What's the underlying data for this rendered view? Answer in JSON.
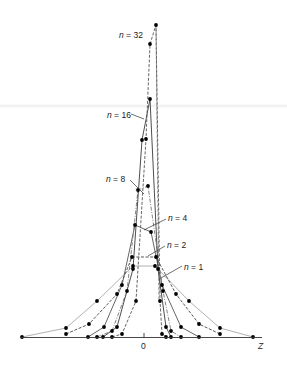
{
  "chart_data": {
    "type": "line",
    "title": "",
    "xlabel": "Z",
    "ylabel": "",
    "x_tick_labels": [
      "0"
    ],
    "grid": false,
    "legend": "inline labels with leader lines",
    "series": [
      {
        "name": "n = 1",
        "label": "n = 1",
        "style": "solid light gray",
        "points": [
          [
            22,
            337
          ],
          [
            66,
            328
          ],
          [
            97,
            301
          ],
          [
            133,
            266
          ],
          [
            155,
            266
          ],
          [
            189,
            301
          ],
          [
            220,
            328
          ],
          [
            253,
            337
          ]
        ],
        "label_pos": [
          184,
          267
        ],
        "leader": [
          [
            182,
            266
          ],
          [
            161,
            278
          ]
        ]
      },
      {
        "name": "n = 2",
        "label": "n = 2",
        "style": "dashed",
        "points": [
          [
            66,
            334
          ],
          [
            89,
            324
          ],
          [
            117,
            294
          ],
          [
            132,
            257
          ],
          [
            156,
            257
          ],
          [
            176,
            294
          ],
          [
            199,
            324
          ],
          [
            220,
            334
          ]
        ],
        "label_pos": [
          167,
          246
        ],
        "leader": [
          [
            165,
            246
          ],
          [
            148,
            256
          ]
        ]
      },
      {
        "name": "n = 4",
        "label": "n = 4",
        "style": "solid",
        "points": [
          [
            88,
            337
          ],
          [
            104,
            327
          ],
          [
            122,
            285
          ],
          [
            135,
            225
          ],
          [
            151,
            232
          ],
          [
            162,
            285
          ],
          [
            181,
            327
          ],
          [
            199,
            337
          ]
        ],
        "label_pos": [
          168,
          218
        ],
        "leader": [
          [
            166,
            219
          ],
          [
            144,
            230
          ]
        ]
      },
      {
        "name": "n = 8",
        "label": "n = 8",
        "style": "dash-dot",
        "points": [
          [
            97,
            337
          ],
          [
            112,
            331
          ],
          [
            127,
            291
          ],
          [
            138,
            190
          ],
          [
            148,
            186
          ],
          [
            163,
            291
          ],
          [
            171,
            331
          ],
          [
            181,
            337
          ]
        ],
        "label_pos": [
          106,
          180
        ],
        "leader": [
          [
            130,
            180
          ],
          [
            144,
            194
          ]
        ]
      },
      {
        "name": "n = 16",
        "label": "n = 16",
        "style": "solid",
        "points": [
          [
            103,
            337
          ],
          [
            117,
            327
          ],
          [
            133,
            269
          ],
          [
            142,
            140
          ],
          [
            150,
            99
          ],
          [
            158,
            269
          ],
          [
            166,
            327
          ],
          [
            171,
            337
          ]
        ],
        "label_pos": [
          107,
          116
        ],
        "leader": [
          [
            131,
            114
          ],
          [
            144,
            119
          ]
        ]
      },
      {
        "name": "n = 32",
        "label": "n = 32",
        "style": "dashed",
        "points": [
          [
            112,
            337
          ],
          [
            122,
            334
          ],
          [
            136,
            301
          ],
          [
            146,
            139
          ],
          [
            150,
            44
          ],
          [
            156,
            25
          ],
          [
            160,
            301
          ],
          [
            162,
            334
          ],
          [
            166,
            337
          ]
        ],
        "label_pos": [
          119,
          35
        ],
        "leader": [
          [
            150,
            44
          ],
          [
            156,
            25
          ]
        ]
      }
    ]
  },
  "axis": {
    "zero_label": "0",
    "z_label": "Z"
  },
  "labels": {
    "n1": "n = 1",
    "n2": "n = 2",
    "n4": "n = 4",
    "n8": "n = 8",
    "n16": "n = 16",
    "n32": "n = 32"
  },
  "colors": {
    "n1": "#a8a8a8",
    "n2": "#444444",
    "n4": "#555555",
    "n8": "#777777",
    "n16": "#3a3a3a",
    "n32": "#555555",
    "points": "#000000"
  }
}
